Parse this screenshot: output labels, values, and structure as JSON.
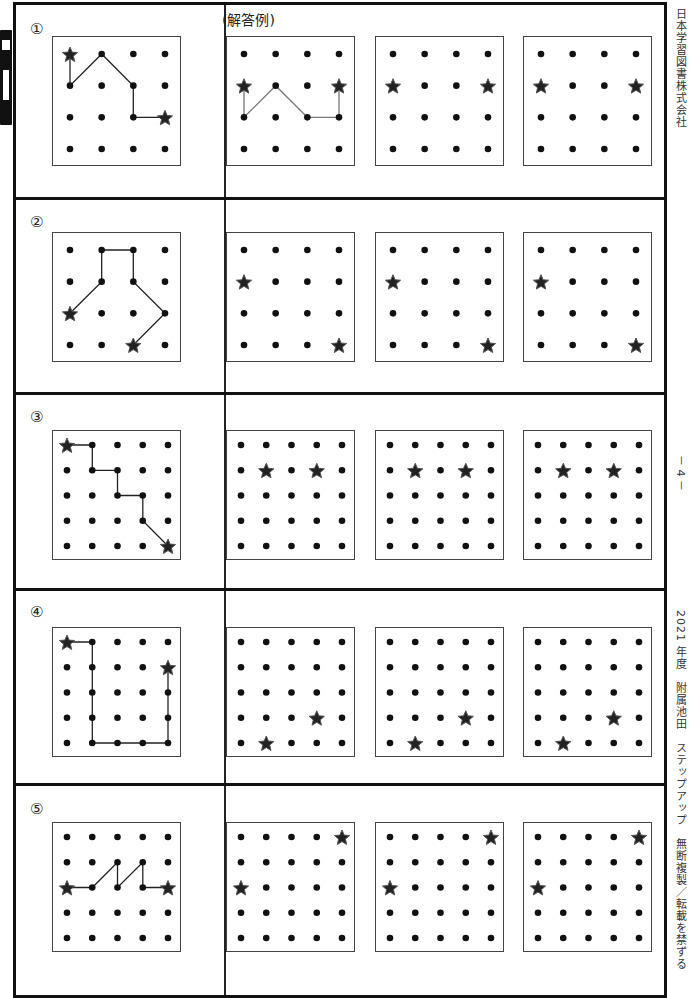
{
  "header": {
    "answer_example_label": "(解答例)"
  },
  "side_labels": {
    "publisher": "日本学習図書株式会社",
    "page": "－ 4 －",
    "footer": "2021 年度　附属池田　ステップアップ　無断複製／転載を禁ずる"
  },
  "problems": [
    {
      "number": "①",
      "grid_size": 4,
      "stars": [
        [
          0,
          0
        ],
        [
          3,
          2
        ]
      ],
      "example_path": [
        [
          0,
          0
        ],
        [
          0,
          1
        ],
        [
          1,
          0
        ],
        [
          2,
          1
        ],
        [
          2,
          2
        ],
        [
          3,
          2
        ]
      ],
      "answer_example": {
        "stars": [
          [
            0,
            1
          ],
          [
            3,
            1
          ]
        ],
        "path": [
          [
            0,
            1
          ],
          [
            0,
            2
          ],
          [
            1,
            1
          ],
          [
            2,
            2
          ],
          [
            3,
            2
          ],
          [
            3,
            1
          ]
        ]
      },
      "practice": [
        {
          "stars": [
            [
              0,
              1
            ],
            [
              3,
              1
            ]
          ]
        },
        {
          "stars": [
            [
              0,
              1
            ],
            [
              3,
              1
            ]
          ]
        }
      ],
      "answer_grid": {
        "stars": [
          [
            0,
            1
          ],
          [
            3,
            1
          ]
        ]
      }
    },
    {
      "number": "②",
      "grid_size": 4,
      "stars": [
        [
          0,
          2
        ],
        [
          2,
          3
        ]
      ],
      "example_path": [
        [
          0,
          2
        ],
        [
          1,
          1
        ],
        [
          1,
          0
        ],
        [
          2,
          0
        ],
        [
          2,
          1
        ],
        [
          3,
          2
        ],
        [
          2,
          3
        ]
      ],
      "practice": [
        {
          "stars": [
            [
              0,
              1
            ],
            [
              3,
              3
            ]
          ]
        },
        {
          "stars": [
            [
              0,
              1
            ],
            [
              3,
              3
            ]
          ]
        },
        {
          "stars": [
            [
              0,
              1
            ],
            [
              3,
              3
            ]
          ]
        }
      ]
    },
    {
      "number": "③",
      "grid_size": 5,
      "stars": [
        [
          0,
          0
        ],
        [
          4,
          4
        ]
      ],
      "example_path": [
        [
          0,
          0
        ],
        [
          1,
          0
        ],
        [
          1,
          1
        ],
        [
          2,
          1
        ],
        [
          2,
          2
        ],
        [
          3,
          2
        ],
        [
          3,
          3
        ],
        [
          4,
          4
        ]
      ],
      "practice": [
        {
          "stars": [
            [
              1,
              1
            ],
            [
              3,
              1
            ]
          ]
        },
        {
          "stars": [
            [
              1,
              1
            ],
            [
              3,
              1
            ]
          ]
        },
        {
          "stars": [
            [
              1,
              1
            ],
            [
              3,
              1
            ]
          ]
        }
      ]
    },
    {
      "number": "④",
      "grid_size": 5,
      "stars": [
        [
          0,
          0
        ],
        [
          4,
          1
        ]
      ],
      "example_path": [
        [
          0,
          0
        ],
        [
          1,
          0
        ],
        [
          1,
          1
        ],
        [
          1,
          2
        ],
        [
          1,
          3
        ],
        [
          1,
          4
        ],
        [
          2,
          4
        ],
        [
          3,
          4
        ],
        [
          4,
          4
        ],
        [
          4,
          3
        ],
        [
          4,
          2
        ],
        [
          4,
          1
        ]
      ],
      "practice": [
        {
          "stars": [
            [
              1,
              4
            ],
            [
              3,
              3
            ]
          ]
        },
        {
          "stars": [
            [
              1,
              4
            ],
            [
              3,
              3
            ]
          ]
        },
        {
          "stars": [
            [
              1,
              4
            ],
            [
              3,
              3
            ]
          ]
        }
      ]
    },
    {
      "number": "⑤",
      "grid_size": 5,
      "stars": [
        [
          0,
          2
        ],
        [
          4,
          2
        ]
      ],
      "example_path": [
        [
          0,
          2
        ],
        [
          1,
          2
        ],
        [
          2,
          1
        ],
        [
          2,
          2
        ],
        [
          3,
          1
        ],
        [
          3,
          2
        ],
        [
          4,
          2
        ]
      ],
      "practice": [
        {
          "stars": [
            [
              0,
              2
            ],
            [
              4,
              0
            ]
          ]
        },
        {
          "stars": [
            [
              0,
              2
            ],
            [
              4,
              0
            ]
          ]
        },
        {
          "stars": [
            [
              0,
              2
            ],
            [
              4,
              0
            ]
          ]
        }
      ]
    }
  ],
  "colors": {
    "dot": "#111111",
    "line": "#222222",
    "answer_line": "#777777",
    "frame": "#111111"
  }
}
